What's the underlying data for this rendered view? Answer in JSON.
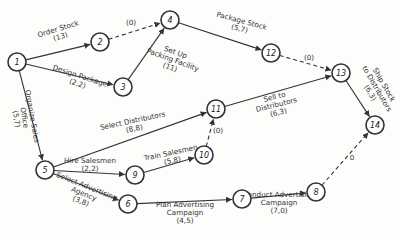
{
  "diagram": {
    "type": "PERT network",
    "nodes": [
      {
        "id": "1",
        "x": 17,
        "y": 62
      },
      {
        "id": "2",
        "x": 100,
        "y": 42
      },
      {
        "id": "3",
        "x": 123,
        "y": 87
      },
      {
        "id": "4",
        "x": 170,
        "y": 20
      },
      {
        "id": "5",
        "x": 45,
        "y": 170
      },
      {
        "id": "6",
        "x": 128,
        "y": 204
      },
      {
        "id": "7",
        "x": 242,
        "y": 199
      },
      {
        "id": "8",
        "x": 316,
        "y": 192
      },
      {
        "id": "9",
        "x": 135,
        "y": 175
      },
      {
        "id": "10",
        "x": 204,
        "y": 155
      },
      {
        "id": "11",
        "x": 216,
        "y": 109
      },
      {
        "id": "12",
        "x": 271,
        "y": 53
      },
      {
        "id": "13",
        "x": 341,
        "y": 73
      },
      {
        "id": "14",
        "x": 375,
        "y": 125
      }
    ],
    "activities": [
      {
        "from": "1",
        "to": "2",
        "name": "Order Stock",
        "time": "(13)",
        "dummy": false,
        "lx": 60,
        "ly": 35,
        "rot": -17
      },
      {
        "from": "1",
        "to": "3",
        "name": "Design Package",
        "time": "(2,2)",
        "dummy": false,
        "lx": 78,
        "ly": 82,
        "rot": 18
      },
      {
        "from": "2",
        "to": "4",
        "name": "",
        "time": "(0)",
        "dummy": true,
        "lx": 131,
        "ly": 25,
        "rot": 0
      },
      {
        "from": "3",
        "to": "4",
        "name": "Set Up Packing Facility",
        "time": "(11)",
        "dummy": false,
        "lx": 172,
        "ly": 62,
        "rot": 20
      },
      {
        "from": "4",
        "to": "12",
        "name": "Package Stock",
        "time": "(5,7)",
        "dummy": false,
        "lx": 240,
        "ly": 27,
        "rot": 15
      },
      {
        "from": "12",
        "to": "13",
        "name": "",
        "time": "(0)",
        "dummy": true,
        "lx": 309,
        "ly": 60,
        "rot": 0
      },
      {
        "from": "1",
        "to": "5",
        "name": "Organize Sales Office",
        "time": "(5,7)",
        "dummy": false,
        "lx": 22,
        "ly": 118,
        "rot": 80
      },
      {
        "from": "5",
        "to": "11",
        "name": "Select Distributors",
        "time": "(8,8)",
        "dummy": false,
        "lx": 134,
        "ly": 127,
        "rot": -12
      },
      {
        "from": "11",
        "to": "13",
        "name": "Sell to Distributors",
        "time": "(6,3)",
        "dummy": false,
        "lx": 277,
        "ly": 107,
        "rot": -14
      },
      {
        "from": "13",
        "to": "14",
        "name": "Ship Stock to Distributors",
        "time": "(6,3)",
        "dummy": false,
        "lx": 375,
        "ly": 90,
        "rot": 60
      },
      {
        "from": "5",
        "to": "9",
        "name": "Hire Salesmen",
        "time": "(2,2)",
        "dummy": false,
        "lx": 90,
        "ly": 167,
        "rot": 0
      },
      {
        "from": "9",
        "to": "10",
        "name": "Train Salesmen",
        "time": "(5,8)",
        "dummy": false,
        "lx": 172,
        "ly": 159,
        "rot": -12
      },
      {
        "from": "10",
        "to": "11",
        "name": "",
        "time": "(0)",
        "dummy": true,
        "lx": 218,
        "ly": 133,
        "rot": 0
      },
      {
        "from": "5",
        "to": "6",
        "name": "Select Advertising Agency",
        "time": "(3,8)",
        "dummy": false,
        "lx": 83,
        "ly": 196,
        "rot": 22
      },
      {
        "from": "6",
        "to": "7",
        "name": "Plan Advertising Campaign",
        "time": "(4,5)",
        "dummy": false,
        "lx": 185,
        "ly": 215,
        "rot": 0
      },
      {
        "from": "7",
        "to": "8",
        "name": "Conduct Advertising Campaign",
        "time": "(7,0)",
        "dummy": false,
        "lx": 279,
        "ly": 205,
        "rot": 0
      },
      {
        "from": "8",
        "to": "14",
        "name": "",
        "time": "0",
        "dummy": true,
        "lx": 352,
        "ly": 160,
        "rot": 0
      }
    ]
  }
}
